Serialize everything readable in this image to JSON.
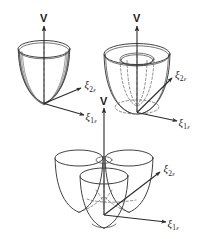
{
  "figure": {
    "caption": "",
    "background_color": "#ffffff",
    "ink_color": "#2b2b2b",
    "dashed_color": "#6a6a6a"
  },
  "axis_labels": {
    "vertical": "V",
    "xi_symbol": "ξ",
    "sub_one": "1",
    "sub_two": "2",
    "epsilon": "ε"
  },
  "panels": [
    {
      "id": "panel-top-left",
      "name": "single-well-paraboloid",
      "description": "Single paraboloid potential well",
      "vertical_axis_label": "V",
      "axis_1_label": "ξ",
      "axis_1_sub": "1",
      "axis_1_eps": "ε",
      "axis_2_label": "ξ",
      "axis_2_sub": "2",
      "axis_2_eps": "ε",
      "wells": 1
    },
    {
      "id": "panel-top-right",
      "name": "mexican-hat-trough",
      "description": "Mexican-hat potential with continuous circular trough",
      "vertical_axis_label": "V",
      "axis_1_label": "ξ",
      "axis_1_sub": "1",
      "axis_1_eps": "ε",
      "axis_2_label": "ξ",
      "axis_2_sub": "2",
      "axis_2_eps": "ε",
      "wells": 0
    },
    {
      "id": "panel-bottom",
      "name": "three-well-tricorn",
      "description": "Warped potential with three equivalent minima",
      "vertical_axis_label": "V",
      "axis_1_label": "ξ",
      "axis_1_sub": "1",
      "axis_1_eps": "ε",
      "axis_2_label": "ξ",
      "axis_2_sub": "2",
      "axis_2_eps": "ε",
      "wells": 3
    }
  ]
}
